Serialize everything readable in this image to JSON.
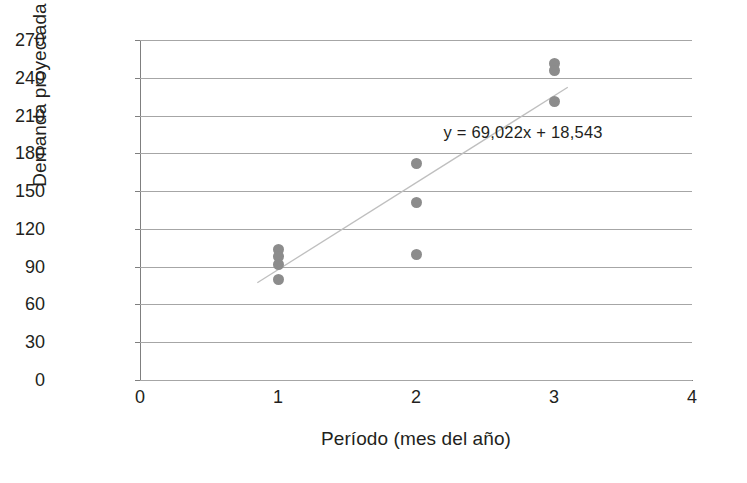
{
  "chart_data": {
    "type": "scatter",
    "title": "",
    "xlabel": "Período (mes del año)",
    "ylabel": "Demanda proyectada",
    "xlim": [
      0,
      4
    ],
    "ylim": [
      0,
      270
    ],
    "x_ticks": [
      "0",
      "1",
      "2",
      "3",
      "4"
    ],
    "x_tick_values": [
      0,
      1,
      2,
      3,
      4
    ],
    "y_ticks": [
      "0",
      "30",
      "60",
      "90",
      "120",
      "150",
      "180",
      "210",
      "240",
      "270"
    ],
    "y_tick_values": [
      0,
      30,
      60,
      90,
      120,
      150,
      180,
      210,
      240,
      270
    ],
    "grid": "horizontal",
    "legend": "none",
    "marker_color": "#8c8c8c",
    "trendline_color": "#bfbfbf",
    "points": [
      {
        "x": 1,
        "y": 104
      },
      {
        "x": 1,
        "y": 98
      },
      {
        "x": 1,
        "y": 92
      },
      {
        "x": 1,
        "y": 80
      },
      {
        "x": 2,
        "y": 172
      },
      {
        "x": 2,
        "y": 141
      },
      {
        "x": 2,
        "y": 100
      },
      {
        "x": 3,
        "y": 251
      },
      {
        "x": 3,
        "y": 246
      },
      {
        "x": 3,
        "y": 221
      }
    ],
    "trendline": {
      "equation": "y = 69,022x + 18,543",
      "slope": 69.022,
      "intercept": 18.543,
      "x_start": 0.85,
      "x_end": 3.1
    },
    "annotations": [
      {
        "name": "trendline-equation",
        "text": "y = 69,022x + 18,543",
        "x": 2.2,
        "y": 196
      }
    ]
  }
}
